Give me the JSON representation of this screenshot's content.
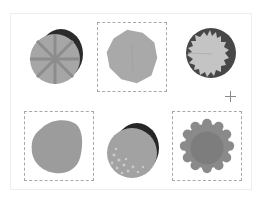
{
  "grid": {
    "items": [
      {
        "id": "tile-1",
        "shape": "sliced-disc",
        "selected": false,
        "fill": "#a6a6a6",
        "shadow": "#2b2b2b",
        "lines": "#8c8c8c"
      },
      {
        "id": "tile-2",
        "shape": "irregular-blob",
        "selected": true,
        "fill": "#a9a9a9"
      },
      {
        "id": "tile-3",
        "shape": "sunburst-disc",
        "selected": false,
        "fill": "#c4c4c4",
        "shadow": "#474747"
      },
      {
        "id": "tile-4",
        "shape": "rounded-blob",
        "selected": true,
        "fill": "#9c9c9c"
      },
      {
        "id": "tile-5",
        "shape": "speckled-disc",
        "selected": false,
        "fill": "#a2a2a2",
        "shadow": "#262626",
        "speckle": "#c9c9c9"
      },
      {
        "id": "tile-6",
        "shape": "scalloped-disc",
        "selected": true,
        "fill": "#8a8a8a",
        "inner": "#7d7d7d"
      }
    ]
  },
  "cursor": {
    "type": "crosshair",
    "x": 230,
    "y": 96
  },
  "colors": {
    "selection_border": "#a8a8a8",
    "panel_border": "#eeeeee",
    "background": "#ffffff"
  }
}
